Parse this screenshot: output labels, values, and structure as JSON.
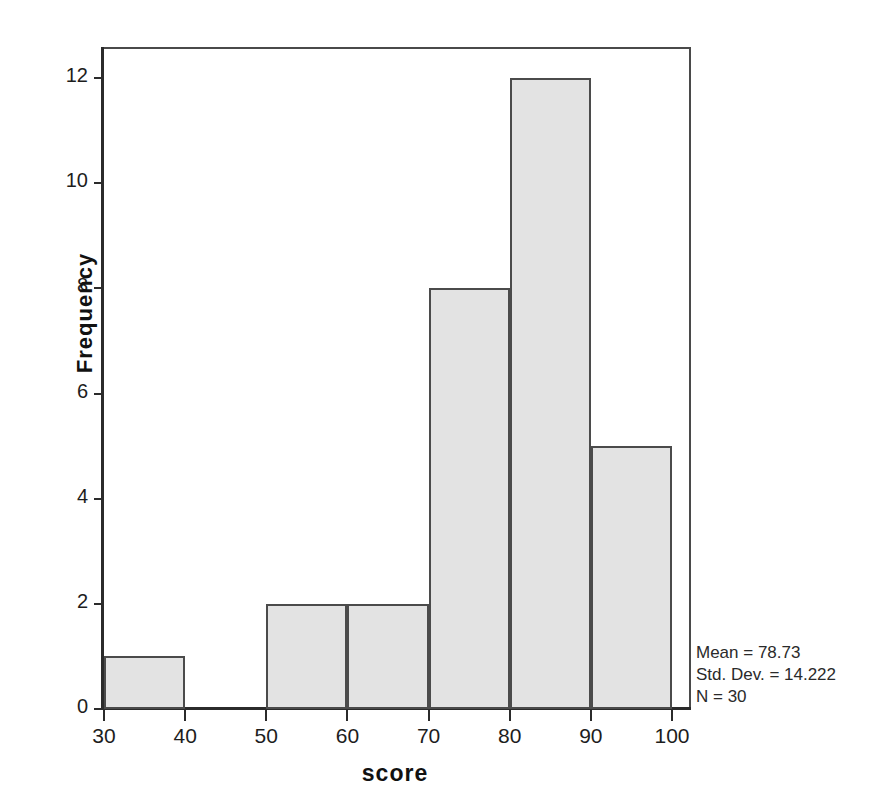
{
  "chart_data": {
    "type": "bar",
    "title": "",
    "subtitle": "",
    "xlabel": "score",
    "ylabel": "Frequency",
    "xlim": [
      26,
      104
    ],
    "ylim": [
      0,
      12.5
    ],
    "xticks": [
      "30",
      "40",
      "50",
      "60",
      "70",
      "80",
      "90",
      "100"
    ],
    "yticks": [
      "0",
      "2",
      "4",
      "6",
      "8",
      "10",
      "12"
    ],
    "grid": false,
    "legend": false,
    "bin_width": 10,
    "categories": [
      "30-40",
      "40-50",
      "50-60",
      "60-70",
      "70-80",
      "80-90",
      "90-100"
    ],
    "bin_edges": [
      30,
      40,
      50,
      60,
      70,
      80,
      90,
      100
    ],
    "values": [
      1,
      0,
      2,
      2,
      8,
      12,
      5
    ],
    "bars": [
      {
        "label": "30-40",
        "x0": 30,
        "x1": 40,
        "value": 1
      },
      {
        "label": "40-50",
        "x0": 40,
        "x1": 50,
        "value": 0
      },
      {
        "label": "50-60",
        "x0": 50,
        "x1": 60,
        "value": 2
      },
      {
        "label": "60-70",
        "x0": 60,
        "x1": 70,
        "value": 2
      },
      {
        "label": "70-80",
        "x0": 70,
        "x1": 80,
        "value": 8
      },
      {
        "label": "80-90",
        "x0": 80,
        "x1": 90,
        "value": 12
      },
      {
        "label": "90-100",
        "x0": 90,
        "x1": 100,
        "value": 5
      }
    ],
    "annotations": [
      "Mean = 78.73",
      "Std. Dev. = 14.222",
      "N = 30"
    ],
    "colors": {
      "bar_fill": "#e3e3e3",
      "bar_border": "#4b4b4b",
      "axis": "#2b2b2b",
      "text": "#1d1d1d",
      "background": "#ffffff"
    }
  },
  "stats": {
    "mean_text": "Mean = 78.73",
    "stddev_text": "Std. Dev. = 14.222",
    "n_text": "N = 30"
  }
}
